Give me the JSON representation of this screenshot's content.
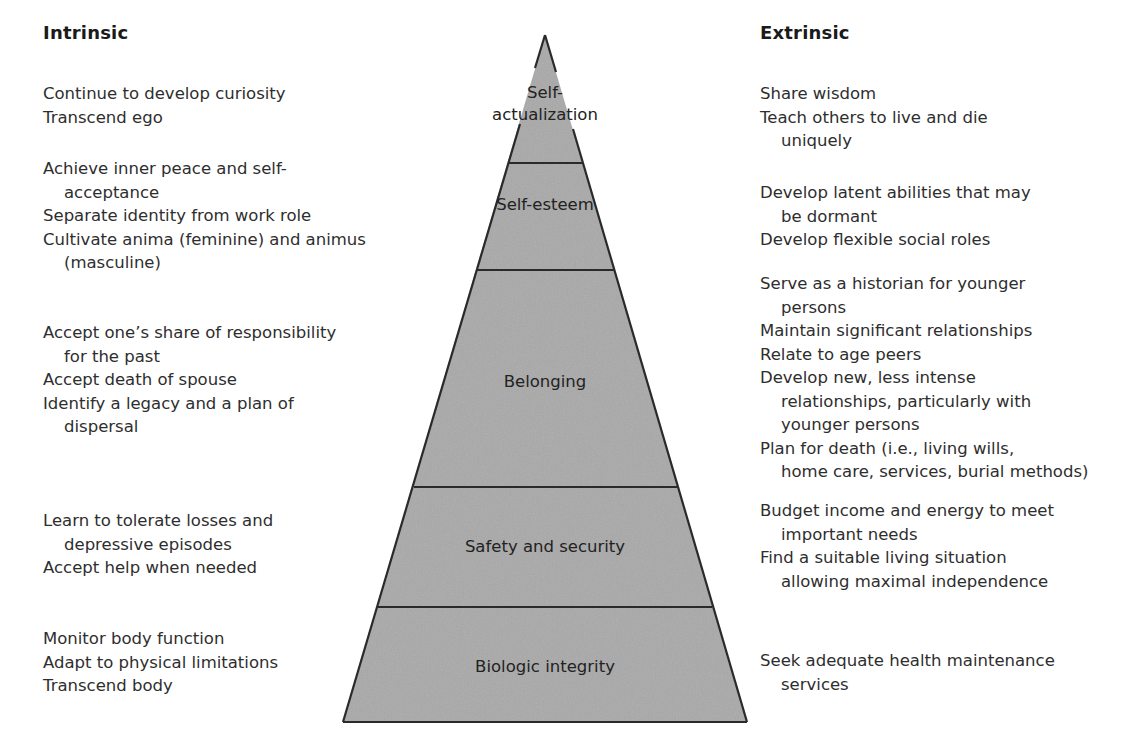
{
  "intrinsic": {
    "heading": "Intrinsic",
    "groups": [
      {
        "tier": "Self-actualization",
        "items": [
          {
            "line": "Continue to develop curiosity",
            "cont": ""
          },
          {
            "line": "Transcend ego",
            "cont": ""
          }
        ]
      },
      {
        "tier": "Self-esteem",
        "items": [
          {
            "line": "Achieve inner peace and self-",
            "cont": "acceptance"
          },
          {
            "line": "Separate identity from work role",
            "cont": ""
          },
          {
            "line": "Cultivate anima (feminine) and animus",
            "cont": "(masculine)"
          }
        ]
      },
      {
        "tier": "Belonging",
        "items": [
          {
            "line": "Accept one’s share of responsibility",
            "cont": "for the past"
          },
          {
            "line": "Accept death of spouse",
            "cont": ""
          },
          {
            "line": "Identify a legacy and a plan of",
            "cont": "dispersal"
          }
        ]
      },
      {
        "tier": "Safety and security",
        "items": [
          {
            "line": "Learn to tolerate losses and",
            "cont": "depressive episodes"
          },
          {
            "line": "Accept help when needed",
            "cont": ""
          }
        ]
      },
      {
        "tier": "Biologic integrity",
        "items": [
          {
            "line": "Monitor body function",
            "cont": ""
          },
          {
            "line": "Adapt to physical limitations",
            "cont": ""
          },
          {
            "line": "Transcend body",
            "cont": ""
          }
        ]
      }
    ]
  },
  "extrinsic": {
    "heading": "Extrinsic",
    "groups": [
      {
        "tier": "Self-actualization",
        "items": [
          {
            "line": "Share wisdom",
            "cont": ""
          },
          {
            "line": "Teach others to live and die",
            "cont": "uniquely"
          }
        ]
      },
      {
        "tier": "Self-esteem",
        "items": [
          {
            "line": "Develop latent abilities that may",
            "cont": "be dormant"
          },
          {
            "line": "Develop flexible social roles",
            "cont": ""
          }
        ]
      },
      {
        "tier": "Belonging",
        "items": [
          {
            "line": "Serve as a historian for younger",
            "cont": "persons"
          },
          {
            "line": "Maintain significant relationships",
            "cont": ""
          },
          {
            "line": "Relate to age peers",
            "cont": ""
          },
          {
            "line": "Develop new, less intense",
            "cont": "relationships, particularly with",
            "cont2": "younger persons"
          },
          {
            "line": "Plan for death (i.e., living wills,",
            "cont": "home care, services, burial methods)"
          }
        ]
      },
      {
        "tier": "Safety and security",
        "items": [
          {
            "line": "Budget income and energy to meet",
            "cont": "important needs"
          },
          {
            "line": "Find a suitable living situation",
            "cont": "allowing maximal independence"
          }
        ]
      },
      {
        "tier": "Biologic integrity",
        "items": [
          {
            "line": "Seek adequate health maintenance",
            "cont": "services"
          }
        ]
      }
    ]
  },
  "pyramid": {
    "tiers": [
      {
        "label_line1": "Self-",
        "label_line2": "actualization"
      },
      {
        "label_line1": "Self-esteem"
      },
      {
        "label_line1": "Belonging"
      },
      {
        "label_line1": "Safety and security"
      },
      {
        "label_line1": "Biologic integrity"
      }
    ],
    "fill_color": "#a9a9a9",
    "outline_color": "#2a2a2a"
  }
}
